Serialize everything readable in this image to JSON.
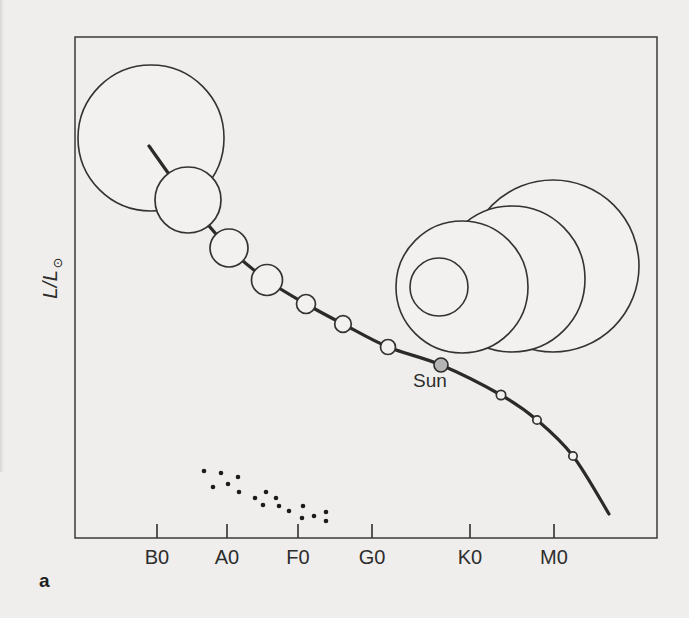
{
  "figure": {
    "panel_label": "a",
    "y_axis_label_main": "L/L",
    "y_axis_label_sub": "⊙"
  },
  "colors": {
    "background": "#efeeec",
    "star_fill": "#f2f1ef",
    "stroke": "#333333",
    "curve": "#2a2a2a",
    "box": "#3a3a3a",
    "text": "#2d2d2d",
    "sun_fill": "#b4b4b4",
    "dot": "#1c1c1c"
  },
  "chart_data": {
    "type": "scatter",
    "title": "",
    "xlabel": "",
    "ylabel": "L/L⊙",
    "x_tick_labels": [
      "B0",
      "A0",
      "F0",
      "G0",
      "K0",
      "M0"
    ],
    "x_tick_px": [
      157,
      227,
      298,
      372,
      470,
      554
    ],
    "tick_len_px": 14,
    "tick_label_y_px": 564,
    "tick_label_font_px": 20,
    "plot_box_px": {
      "left": 75,
      "top": 37,
      "right": 657,
      "bottom": 538
    },
    "main_sequence": {
      "curve_px": [
        [
          149,
          146
        ],
        [
          188,
          200
        ],
        [
          229,
          248
        ],
        [
          267,
          280
        ],
        [
          306,
          304
        ],
        [
          343,
          324
        ],
        [
          388,
          347
        ],
        [
          441,
          365
        ],
        [
          501,
          395
        ],
        [
          537,
          420
        ],
        [
          573,
          456
        ],
        [
          609,
          514
        ]
      ],
      "stars_px": [
        {
          "x": 151,
          "y": 138,
          "r": 73
        },
        {
          "x": 188,
          "y": 200,
          "r": 33
        },
        {
          "x": 229,
          "y": 248,
          "r": 19
        },
        {
          "x": 267,
          "y": 280,
          "r": 15.5
        },
        {
          "x": 306,
          "y": 304,
          "r": 9.5
        },
        {
          "x": 343,
          "y": 324,
          "r": 8.3
        },
        {
          "x": 388,
          "y": 347,
          "r": 7.5
        },
        {
          "x": 501,
          "y": 395,
          "r": 4.7
        },
        {
          "x": 537,
          "y": 420,
          "r": 4.2
        },
        {
          "x": 573,
          "y": 456,
          "r": 4.2
        }
      ],
      "sun_px": {
        "x": 441,
        "y": 365,
        "r": 7,
        "label": "Sun"
      },
      "sun_label_px": {
        "x": 430,
        "y": 387,
        "font_px": 19
      }
    },
    "giants_px": [
      {
        "x": 553,
        "y": 266,
        "r": 86
      },
      {
        "x": 512,
        "y": 279,
        "r": 73
      },
      {
        "x": 462,
        "y": 287,
        "r": 66
      },
      {
        "x": 439,
        "y": 287,
        "r": 29
      }
    ],
    "white_dwarfs_px": {
      "dot_r": 2.3,
      "points": [
        [
          204,
          471
        ],
        [
          213,
          487
        ],
        [
          221,
          473
        ],
        [
          228,
          484
        ],
        [
          238,
          477
        ],
        [
          239,
          492
        ],
        [
          255,
          498
        ],
        [
          263,
          505
        ],
        [
          266,
          492
        ],
        [
          276,
          498
        ],
        [
          279,
          506
        ],
        [
          289,
          511
        ],
        [
          303,
          506
        ],
        [
          302,
          518
        ],
        [
          314,
          516
        ],
        [
          326,
          512
        ],
        [
          326,
          521
        ]
      ]
    }
  }
}
